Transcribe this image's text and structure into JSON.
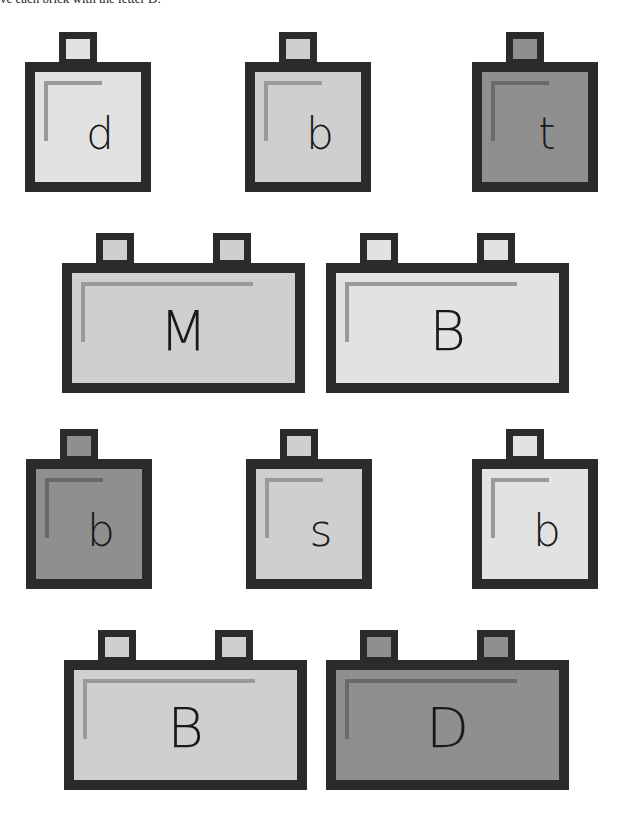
{
  "instruction": "ve each brick with the letter D.",
  "colors": {
    "outline": "#2b2b2b",
    "light": "#e2e2e2",
    "medium": "#cfcfcf",
    "dark": "#8f8f8f",
    "highlight_light": "#9a9a9a",
    "highlight_dark": "#6a6a6a"
  },
  "bricks": [
    {
      "letter": "d",
      "size": "single",
      "shade": "light",
      "x": 25,
      "y": 32
    },
    {
      "letter": "b",
      "size": "single",
      "shade": "medium",
      "x": 245,
      "y": 32
    },
    {
      "letter": "t",
      "size": "single",
      "shade": "dark",
      "x": 472,
      "y": 32
    },
    {
      "letter": "M",
      "size": "double",
      "shade": "medium",
      "x": 62,
      "y": 233
    },
    {
      "letter": "B",
      "size": "double",
      "shade": "light",
      "x": 326,
      "y": 233
    },
    {
      "letter": "b",
      "size": "single",
      "shade": "dark",
      "x": 26,
      "y": 429
    },
    {
      "letter": "s",
      "size": "single",
      "shade": "medium",
      "x": 246,
      "y": 429
    },
    {
      "letter": "b",
      "size": "single",
      "shade": "light",
      "x": 472,
      "y": 429
    },
    {
      "letter": "B",
      "size": "double",
      "shade": "medium",
      "x": 64,
      "y": 630
    },
    {
      "letter": "D",
      "size": "double",
      "shade": "dark",
      "x": 326,
      "y": 630
    }
  ]
}
